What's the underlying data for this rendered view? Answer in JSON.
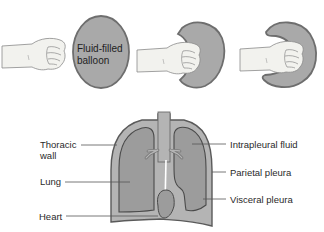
{
  "colors": {
    "balloon_fill": "#a9a9a9",
    "balloon_stroke": "#6e6e6e",
    "wall_fill": "#b4b4b4",
    "lung_fill": "#9c9c9c",
    "line": "#555555",
    "skin": "#f2f2ee",
    "skin_stroke": "#8a8a8a",
    "text": "#2a2a2a"
  },
  "top_panel": {
    "balloon_label_line1": "Fluid-filled",
    "balloon_label_line2": "balloon"
  },
  "bottom_panel": {
    "labels": {
      "thoracic_wall_line1": "Thoracic",
      "thoracic_wall_line2": "wall",
      "lung": "Lung",
      "heart": "Heart",
      "intrapleural_fluid": "Intrapleural fluid",
      "parietal_pleura": "Parietal pleura",
      "visceral_pleura": "Visceral pleura"
    }
  }
}
